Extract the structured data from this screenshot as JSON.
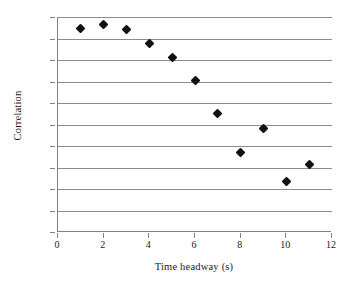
{
  "chart_data": {
    "type": "scatter",
    "title": "",
    "xlabel": "Time headway (s)",
    "ylabel": "Correlation",
    "xlim": [
      0,
      12
    ],
    "ylim": [
      0,
      1
    ],
    "grid": "horizontal",
    "legend": "none",
    "marker": "filled-diamond",
    "marker_color": "#111111",
    "grid_color": "#8c8c8c",
    "axis_color": "#808080",
    "background_color": "#ffffff",
    "xticks": [
      0,
      2,
      4,
      6,
      8,
      10,
      12
    ],
    "xtick_labels": [
      "0",
      "2",
      "4",
      "6",
      "8",
      "10",
      "12"
    ],
    "yticks": [
      0,
      0.1,
      0.2,
      0.3,
      0.4,
      0.5,
      0.6,
      0.7,
      0.8,
      0.9,
      1
    ],
    "ytick_labels": [
      "0",
      "0.1",
      "0.2",
      "0.3",
      "0.4",
      "0.5",
      "0.6",
      "0.7",
      "0.8",
      "0.9",
      "1"
    ],
    "x": [
      1,
      2,
      3,
      4,
      5,
      6,
      7,
      8,
      9,
      10,
      11
    ],
    "y": [
      0.945,
      0.967,
      0.94,
      0.878,
      0.811,
      0.703,
      0.55,
      0.37,
      0.48,
      0.237,
      0.313
    ],
    "points": [
      {
        "x": 1,
        "y": 0.945
      },
      {
        "x": 2,
        "y": 0.967
      },
      {
        "x": 3,
        "y": 0.94
      },
      {
        "x": 4,
        "y": 0.878
      },
      {
        "x": 5,
        "y": 0.811
      },
      {
        "x": 6,
        "y": 0.703
      },
      {
        "x": 7,
        "y": 0.55
      },
      {
        "x": 8,
        "y": 0.37
      },
      {
        "x": 9,
        "y": 0.48
      },
      {
        "x": 10,
        "y": 0.237
      },
      {
        "x": 11,
        "y": 0.313
      }
    ]
  }
}
